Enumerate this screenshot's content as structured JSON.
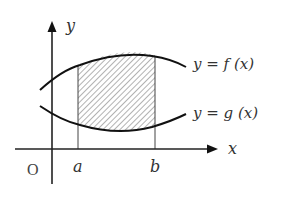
{
  "diagram": {
    "type": "area-between-curves",
    "axes": {
      "x_label": "x",
      "y_label": "y",
      "origin_label": "O"
    },
    "bounds": {
      "left_label": "a",
      "right_label": "b"
    },
    "curves": [
      {
        "id": "upper",
        "label": "y = f (x)"
      },
      {
        "id": "lower",
        "label": "y = g (x)"
      }
    ],
    "shaded_region": "area between f and g from a to b (hatched)",
    "colors": {
      "line": "#1a1a1a",
      "axis": "#333333",
      "hatch": "#555555",
      "background": "#ffffff"
    }
  }
}
